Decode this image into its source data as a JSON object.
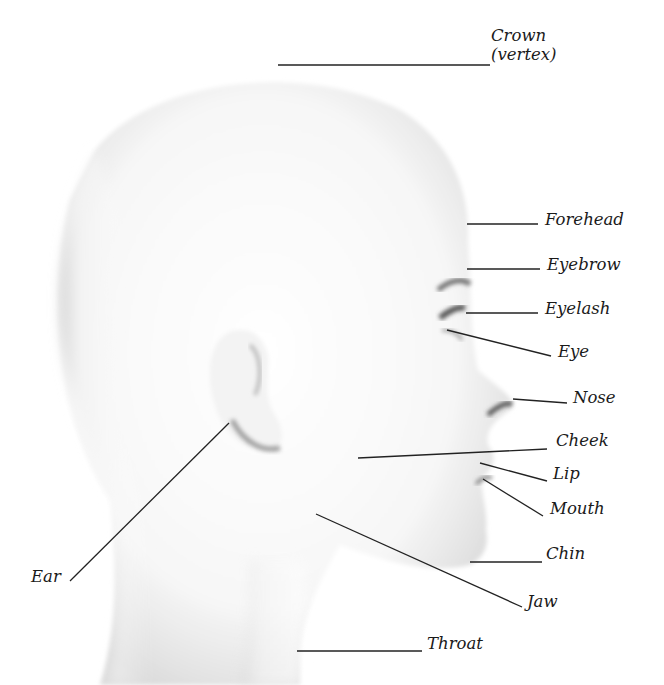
{
  "diagram": {
    "labels": [
      {
        "id": "crown",
        "text": "Crown",
        "x": 491,
        "y": 27
      },
      {
        "id": "vertex",
        "text": "(vertex)",
        "x": 491,
        "y": 46
      },
      {
        "id": "forehead",
        "text": "Forehead",
        "x": 545,
        "y": 211
      },
      {
        "id": "eyebrow",
        "text": "Eyebrow",
        "x": 547,
        "y": 256
      },
      {
        "id": "eyelash",
        "text": "Eyelash",
        "x": 545,
        "y": 300
      },
      {
        "id": "eye",
        "text": "Eye",
        "x": 558,
        "y": 343
      },
      {
        "id": "nose",
        "text": "Nose",
        "x": 573,
        "y": 389
      },
      {
        "id": "cheek",
        "text": "Cheek",
        "x": 556,
        "y": 432
      },
      {
        "id": "lip",
        "text": "Lip",
        "x": 553,
        "y": 465
      },
      {
        "id": "mouth",
        "text": "Mouth",
        "x": 550,
        "y": 500
      },
      {
        "id": "chin",
        "text": "Chin",
        "x": 546,
        "y": 545
      },
      {
        "id": "jaw",
        "text": "Jaw",
        "x": 527,
        "y": 593
      },
      {
        "id": "throat",
        "text": "Throat",
        "x": 427,
        "y": 635
      },
      {
        "id": "ear",
        "text": "Ear",
        "x": 31,
        "y": 568
      }
    ],
    "leaders": [
      {
        "id": "crown",
        "x1": 278,
        "y1": 65,
        "x2": 490,
        "y2": 65
      },
      {
        "id": "forehead",
        "x1": 467,
        "y1": 224,
        "x2": 538,
        "y2": 224
      },
      {
        "id": "eyebrow",
        "x1": 467,
        "y1": 269,
        "x2": 540,
        "y2": 269
      },
      {
        "id": "eyelash",
        "x1": 466,
        "y1": 313,
        "x2": 538,
        "y2": 313
      },
      {
        "id": "eye",
        "x1": 447,
        "y1": 330,
        "x2": 551,
        "y2": 356
      },
      {
        "id": "nose",
        "x1": 513,
        "y1": 399,
        "x2": 567,
        "y2": 403
      },
      {
        "id": "cheek",
        "x1": 358,
        "y1": 458,
        "x2": 547,
        "y2": 449
      },
      {
        "id": "lip",
        "x1": 480,
        "y1": 463,
        "x2": 547,
        "y2": 481
      },
      {
        "id": "mouth",
        "x1": 483,
        "y1": 479,
        "x2": 543,
        "y2": 516
      },
      {
        "id": "chin",
        "x1": 470,
        "y1": 562,
        "x2": 542,
        "y2": 562
      },
      {
        "id": "jaw",
        "x1": 316,
        "y1": 514,
        "x2": 522,
        "y2": 607
      },
      {
        "id": "throat",
        "x1": 297,
        "y1": 651,
        "x2": 422,
        "y2": 651
      },
      {
        "id": "ear",
        "x1": 229,
        "y1": 423,
        "x2": 70,
        "y2": 581
      }
    ],
    "colors": {
      "line": "#222222",
      "text": "#1a1a1a",
      "skin_shadow": "#c8c8c8"
    }
  }
}
